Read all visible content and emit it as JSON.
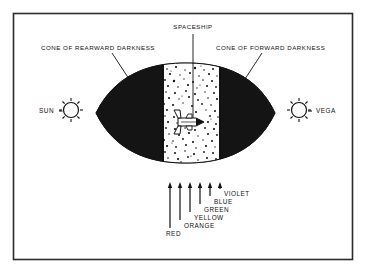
{
  "figure": {
    "title_labels": {
      "spaceship": "SPACESHIP",
      "cone_rearward": "CONE OF REARWARD DARKNESS",
      "cone_forward": "CONE OF FORWARD DARKNESS"
    },
    "stars": {
      "left": "SUN",
      "right": "VEGA"
    },
    "spectrum": {
      "labels": [
        "RED",
        "ORANGE",
        "YELLOW",
        "GREEN",
        "BLUE",
        "VIOLET"
      ],
      "arrow_count": 6
    },
    "colors": {
      "ink": "#111111",
      "dark_cone": "#141414",
      "paper": "#ffffff",
      "frame": "#2b2b2b"
    }
  }
}
